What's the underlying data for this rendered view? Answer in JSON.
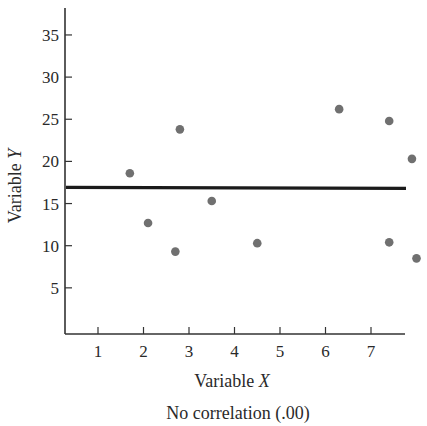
{
  "chart_data": {
    "type": "scatter",
    "title": "",
    "caption": "No correlation (.00)",
    "xlabel": "Variable",
    "xlabel_var": "X",
    "ylabel": "Variable",
    "ylabel_var": "Y",
    "x_ticks": [
      1,
      2,
      3,
      4,
      5,
      6,
      7
    ],
    "y_ticks": [
      5,
      10,
      15,
      20,
      25,
      30,
      35
    ],
    "xlim": [
      0.3,
      7.8
    ],
    "ylim": [
      0,
      38
    ],
    "grid": false,
    "legend": null,
    "points": [
      {
        "x": 1.7,
        "y": 18.6
      },
      {
        "x": 2.1,
        "y": 12.7
      },
      {
        "x": 2.7,
        "y": 9.3
      },
      {
        "x": 2.8,
        "y": 23.8
      },
      {
        "x": 3.5,
        "y": 15.3
      },
      {
        "x": 4.5,
        "y": 10.3
      },
      {
        "x": 6.3,
        "y": 26.2
      },
      {
        "x": 7.4,
        "y": 24.8
      },
      {
        "x": 7.4,
        "y": 10.4
      },
      {
        "x": 7.9,
        "y": 20.3
      },
      {
        "x": 8.0,
        "y": 8.5
      }
    ],
    "regression_line": {
      "x_start": 0.3,
      "x_end": 7.8,
      "y": 16.8,
      "slope": 0.0
    },
    "colors": {
      "points": "#707070",
      "line": "#1a1a1a",
      "axis": "#333333"
    }
  }
}
